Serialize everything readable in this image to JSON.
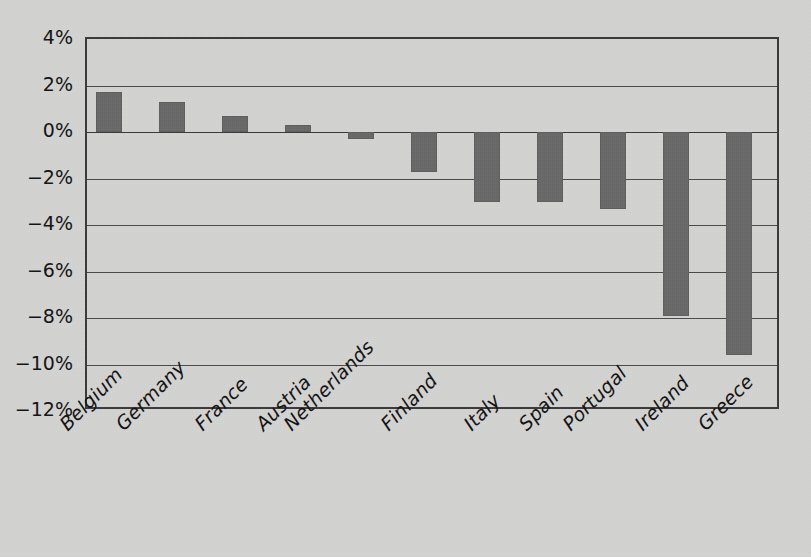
{
  "chart_data": {
    "type": "bar",
    "title": "",
    "subtitle": "",
    "xlabel": "",
    "ylabel": "",
    "categories": [
      "Belgium",
      "Germany",
      "France",
      "Austria",
      "Netherlands",
      "Finland",
      "Italy",
      "Spain",
      "Portugal",
      "Ireland",
      "Greece"
    ],
    "values": [
      1.7,
      1.3,
      0.7,
      0.3,
      -0.3,
      -1.7,
      -3.0,
      -3.0,
      -3.3,
      -7.9,
      -9.6
    ],
    "value_unit": "%",
    "ylim": [
      -12,
      4
    ],
    "ytick_values": [
      4,
      2,
      0,
      -2,
      -4,
      -6,
      -8,
      -10,
      -12
    ],
    "ytick_labels": [
      "4%",
      "2%",
      "0%",
      "−2%",
      "−4%",
      "−6%",
      "−8%",
      "−10%",
      "−12%"
    ],
    "ytick_step": 2,
    "grid": true,
    "grid_axis": "y",
    "legend": false,
    "legend_position": "none",
    "xtick_rotation": -45,
    "bar_color": "#686868",
    "grid_color": "#4a4a4a",
    "background_color": "#d3d3d2",
    "axis_color": "#3a3a3a",
    "text_color": "#111111"
  }
}
